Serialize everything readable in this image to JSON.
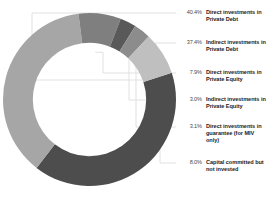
{
  "chart_data": {
    "type": "pie",
    "variant": "donut",
    "title": "",
    "subtitle": "",
    "xlabel": "",
    "ylabel": "",
    "grid": false,
    "legend_position": "right",
    "start_angle_deg": -18,
    "direction": "clockwise",
    "inner_radius_ratio": 0.655,
    "categories": [
      "Direct investments in Private Debt",
      "Indirect investments in Private Debt",
      "Direct investments in Private Equity",
      "Indirect investments in Private Equity",
      "Direct investments in guarantee (for MIV only)",
      "Capital committed but not invested"
    ],
    "values": [
      40.4,
      37.4,
      7.9,
      3.0,
      3.1,
      8.0
    ],
    "value_labels": [
      "40.4%",
      "37.4%",
      "7.9%",
      "3.0%",
      "3.1%",
      "8.0%"
    ],
    "unit": "%",
    "colors": [
      "#4d4d4d",
      "#a6a6a6",
      "#7f7f7f",
      "#595959",
      "#8c8c8c",
      "#bfbfbf"
    ],
    "leader_line_color": "#d9d9d9"
  },
  "legend": {
    "items": [
      {
        "pct": "40.4%",
        "label": "Direct investments in Private Debt",
        "color": "#4d4d4d"
      },
      {
        "pct": "37.4%",
        "label": "Indirect investments in Private Debt",
        "color": "#a6a6a6"
      },
      {
        "pct": "7.9%",
        "label": "Direct investments in Private Equity",
        "color": "#7f7f7f"
      },
      {
        "pct": "3.0%",
        "label": "Indirect investments in Private Equity",
        "color": "#595959"
      },
      {
        "pct": "3.1%",
        "label": "Direct investments in guarantee (for MIV only)",
        "color": "#8c8c8c"
      },
      {
        "pct": "8.0%",
        "label": "Capital committed but not invested",
        "color": "#bfbfbf"
      }
    ]
  },
  "colors": {
    "background": "#ffffff",
    "pct_text": "#4a4a4a",
    "label_text": "#1d1d1d",
    "leader": "#d9d9d9"
  }
}
